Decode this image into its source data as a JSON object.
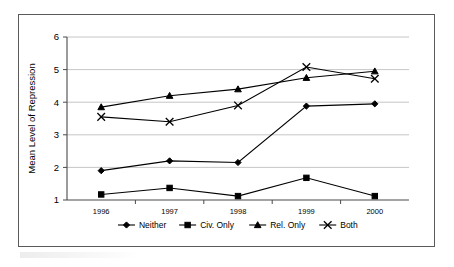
{
  "chart_data": {
    "type": "line",
    "title": "",
    "xlabel": "",
    "ylabel": "Mean Level of Repression",
    "categories": [
      "1996",
      "1997",
      "1998",
      "1999",
      "2000"
    ],
    "ylim": [
      1,
      6
    ],
    "yticks": [
      1,
      2,
      3,
      4,
      5,
      6
    ],
    "grid": true,
    "legend_position": "bottom",
    "series": [
      {
        "name": "Neither",
        "marker": "diamond",
        "values": [
          1.9,
          2.2,
          2.15,
          3.88,
          3.95
        ]
      },
      {
        "name": "Civ. Only",
        "marker": "square",
        "values": [
          1.17,
          1.37,
          1.12,
          1.68,
          1.12
        ]
      },
      {
        "name": "Rel. Only",
        "marker": "triangle",
        "values": [
          3.85,
          4.2,
          4.4,
          4.75,
          4.95
        ]
      },
      {
        "name": "Both",
        "marker": "x",
        "values": [
          3.55,
          3.4,
          3.9,
          5.08,
          4.72
        ]
      }
    ]
  },
  "axis": {
    "y_title": "Mean Level of Repression",
    "y_tick_labels": [
      "6",
      "5",
      "4",
      "3",
      "2",
      "1"
    ],
    "x_tick_labels": [
      "1996",
      "1997",
      "1998",
      "1999",
      "2000"
    ]
  },
  "legend": {
    "items": [
      {
        "label": "Neither",
        "marker": "diamond"
      },
      {
        "label": "Civ. Only",
        "marker": "square"
      },
      {
        "label": "Rel. Only",
        "marker": "triangle"
      },
      {
        "label": "Both",
        "marker": "x"
      }
    ]
  },
  "colors": {
    "series": "#000000",
    "gridline": "#b8b8b8",
    "axis": "#4a4a4a",
    "frame": "#5a5a5a",
    "background": "#ffffff"
  }
}
